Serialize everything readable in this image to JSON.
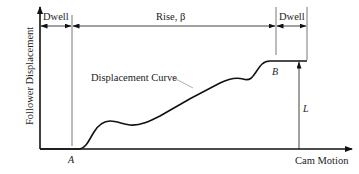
{
  "diagram": {
    "type": "cam-follower-displacement",
    "labels": {
      "dwell_left": "Dwell",
      "rise": "Rise, β",
      "dwell_right": "Dwell",
      "curve": "Displacement Curve",
      "point_a": "A",
      "point_b": "B",
      "lift": "L",
      "y_axis": "Follower Displacement",
      "x_axis": "Cam Motion"
    },
    "colors": {
      "line": "#111111",
      "dim_line": "#555555",
      "text": "#222222"
    }
  }
}
